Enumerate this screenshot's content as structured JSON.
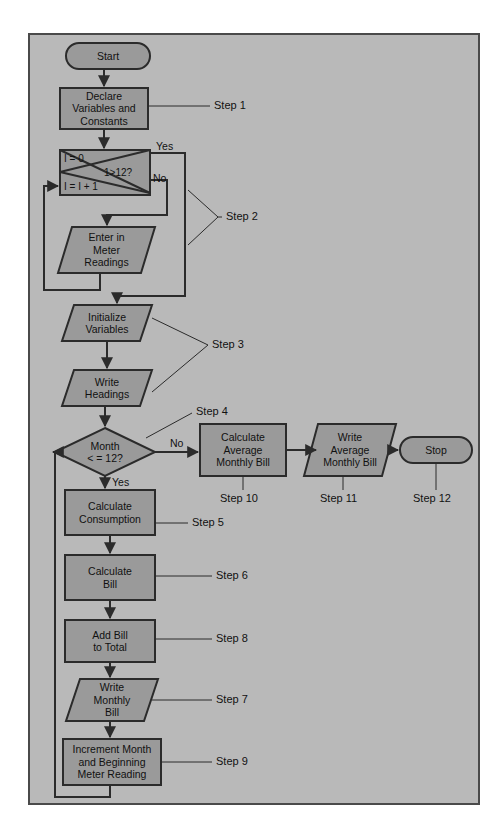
{
  "diagram": {
    "colors": {
      "canvas": "#b9b9b9",
      "node_fill": "#9a9a9a",
      "node_stroke": "#2b2b2b",
      "frame_stroke": "#4a4a4a",
      "text": "#111111",
      "page_background": "#ffffff"
    },
    "nodes": [
      {
        "id": "start",
        "shape": "terminator",
        "text": "Start"
      },
      {
        "id": "declare",
        "shape": "process",
        "text": "Declare\nVariables and\nConstants"
      },
      {
        "id": "loop",
        "shape": "loop-box",
        "text": "",
        "init": "I = 0",
        "increment": "I = I + 1",
        "condition": "1>12?"
      },
      {
        "id": "enter_meter",
        "shape": "io",
        "text": "Enter in\nMeter\nReadings"
      },
      {
        "id": "init_vars",
        "shape": "io",
        "text": "Initialize\nVariables"
      },
      {
        "id": "write_head",
        "shape": "io",
        "text": "Write\nHeadings"
      },
      {
        "id": "month_dec",
        "shape": "decision",
        "text": "Month\n< = 12?"
      },
      {
        "id": "calc_avg",
        "shape": "process",
        "text": "Calculate\nAverage\nMonthly Bill"
      },
      {
        "id": "write_avg",
        "shape": "io",
        "text": "Write\nAverage\nMonthly Bill"
      },
      {
        "id": "stop",
        "shape": "terminator",
        "text": "Stop"
      },
      {
        "id": "calc_cons",
        "shape": "process",
        "text": "Calculate\nConsumption"
      },
      {
        "id": "calc_bill",
        "shape": "process",
        "text": "Calculate\nBill"
      },
      {
        "id": "add_bill",
        "shape": "process",
        "text": "Add Bill\nto Total"
      },
      {
        "id": "write_month",
        "shape": "io",
        "text": "Write\nMonthly\nBill"
      },
      {
        "id": "increment",
        "shape": "process",
        "text": "Increment Month\nand Beginning\nMeter Reading"
      }
    ],
    "edge_labels": [
      {
        "id": "loop_yes",
        "text": "Yes"
      },
      {
        "id": "loop_no",
        "text": "No"
      },
      {
        "id": "month_no",
        "text": "No"
      },
      {
        "id": "month_yes",
        "text": "Yes"
      }
    ],
    "step_labels": [
      {
        "id": "step1",
        "text": "Step 1",
        "bracket": "line"
      },
      {
        "id": "step2",
        "text": "Step 2",
        "bracket": "vee"
      },
      {
        "id": "step3",
        "text": "Step 3",
        "bracket": "vee"
      },
      {
        "id": "step4",
        "text": "Step 4",
        "bracket": "line"
      },
      {
        "id": "step5",
        "text": "Step 5",
        "bracket": "line"
      },
      {
        "id": "step6",
        "text": "Step 6",
        "bracket": "line"
      },
      {
        "id": "step7",
        "text": "Step 7",
        "bracket": "line"
      },
      {
        "id": "step8",
        "text": "Step 8",
        "bracket": "line"
      },
      {
        "id": "step9",
        "text": "Step 9",
        "bracket": "line"
      },
      {
        "id": "step10",
        "text": "Step 10",
        "bracket": "tick"
      },
      {
        "id": "step11",
        "text": "Step 11",
        "bracket": "tick"
      },
      {
        "id": "step12",
        "text": "Step 12",
        "bracket": "tick"
      }
    ]
  }
}
